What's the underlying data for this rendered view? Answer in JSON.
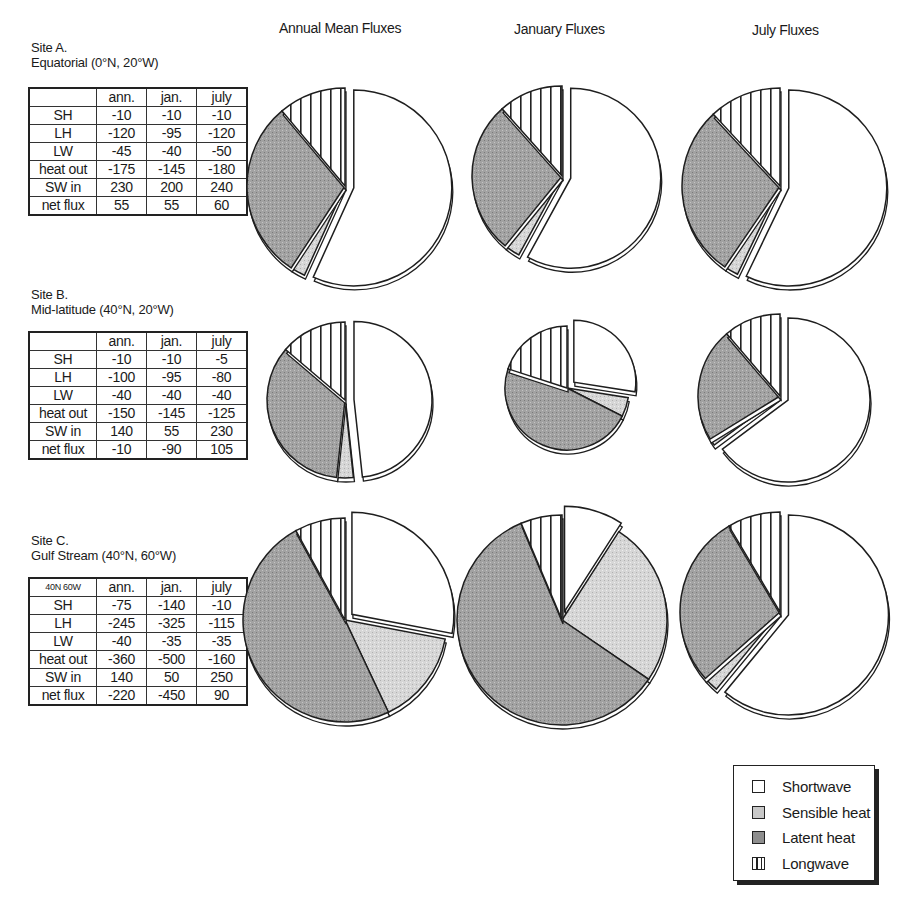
{
  "columns": {
    "annual": "Annual Mean Fluxes",
    "january": "January Fluxes",
    "july": "July Fluxes"
  },
  "sites": [
    {
      "title_line1": "Site A.",
      "title_line2": "Equatorial (0°N, 20°W)",
      "corner": "",
      "headers": [
        "ann.",
        "jan.",
        "july"
      ],
      "rows": [
        {
          "label": "SH",
          "values": [
            "-10",
            "-10",
            "-10"
          ]
        },
        {
          "label": "LH",
          "values": [
            "-120",
            "-95",
            "-120"
          ]
        },
        {
          "label": "LW",
          "values": [
            "-45",
            "-40",
            "-50"
          ]
        },
        {
          "label": "heat out",
          "values": [
            "-175",
            "-145",
            "-180"
          ]
        },
        {
          "label": "SW in",
          "values": [
            "230",
            "200",
            "240"
          ]
        },
        {
          "label": "net flux",
          "values": [
            "55",
            "55",
            "60"
          ]
        }
      ]
    },
    {
      "title_line1": "Site B.",
      "title_line2": "Mid-latitude (40°N, 20°W)",
      "corner": "",
      "headers": [
        "ann.",
        "jan.",
        "july"
      ],
      "rows": [
        {
          "label": "SH",
          "values": [
            "-10",
            "-10",
            "-5"
          ]
        },
        {
          "label": "LH",
          "values": [
            "-100",
            "-95",
            "-80"
          ]
        },
        {
          "label": "LW",
          "values": [
            "-40",
            "-40",
            "-40"
          ]
        },
        {
          "label": "heat out",
          "values": [
            "-150",
            "-145",
            "-125"
          ]
        },
        {
          "label": "SW in",
          "values": [
            "140",
            "55",
            "230"
          ]
        },
        {
          "label": "net flux",
          "values": [
            "-10",
            "-90",
            "105"
          ]
        }
      ]
    },
    {
      "title_line1": "Site C.",
      "title_line2": "Gulf Stream (40°N, 60°W)",
      "corner": "40N 60W",
      "headers": [
        "ann.",
        "jan.",
        "july"
      ],
      "rows": [
        {
          "label": "SH",
          "values": [
            "-75",
            "-140",
            "-10"
          ]
        },
        {
          "label": "LH",
          "values": [
            "-245",
            "-325",
            "-115"
          ]
        },
        {
          "label": "LW",
          "values": [
            "-40",
            "-35",
            "-35"
          ]
        },
        {
          "label": "heat out",
          "values": [
            "-360",
            "-500",
            "-160"
          ]
        },
        {
          "label": "SW in",
          "values": [
            "140",
            "50",
            "250"
          ]
        },
        {
          "label": "net flux",
          "values": [
            "-220",
            "-450",
            "90"
          ]
        }
      ]
    }
  ],
  "legend": [
    {
      "key": "shortwave",
      "label": "Shortwave"
    },
    {
      "key": "sensible",
      "label": "Sensible heat"
    },
    {
      "key": "latent",
      "label": "Latent heat"
    },
    {
      "key": "longwave",
      "label": "Longwave"
    }
  ],
  "colors": {
    "shortwave": "#ffffff",
    "sensible": "#d4d4d4",
    "latent": "#9a9a9a",
    "longwave_stripe": "#222222",
    "outline": "#1e1e1e"
  },
  "chart_data": [
    {
      "type": "pie",
      "title": "Site A. Equatorial (0°N, 20°W) — Annual Mean Fluxes",
      "categories": [
        "Shortwave",
        "Sensible heat",
        "Latent heat",
        "Longwave"
      ],
      "values": [
        230,
        10,
        120,
        45
      ]
    },
    {
      "type": "pie",
      "title": "Site A. Equatorial (0°N, 20°W) — January Fluxes",
      "categories": [
        "Shortwave",
        "Sensible heat",
        "Latent heat",
        "Longwave"
      ],
      "values": [
        200,
        10,
        95,
        40
      ]
    },
    {
      "type": "pie",
      "title": "Site A. Equatorial (0°N, 20°W) — July Fluxes",
      "categories": [
        "Shortwave",
        "Sensible heat",
        "Latent heat",
        "Longwave"
      ],
      "values": [
        240,
        10,
        120,
        50
      ]
    },
    {
      "type": "pie",
      "title": "Site B. Mid-latitude (40°N, 20°W) — Annual Mean Fluxes",
      "categories": [
        "Shortwave",
        "Sensible heat",
        "Latent heat",
        "Longwave"
      ],
      "values": [
        140,
        10,
        100,
        40
      ]
    },
    {
      "type": "pie",
      "title": "Site B. Mid-latitude (40°N, 20°W) — January Fluxes",
      "categories": [
        "Shortwave",
        "Sensible heat",
        "Latent heat",
        "Longwave"
      ],
      "values": [
        55,
        10,
        95,
        40
      ]
    },
    {
      "type": "pie",
      "title": "Site B. Mid-latitude (40°N, 20°W) — July Fluxes",
      "categories": [
        "Shortwave",
        "Sensible heat",
        "Latent heat",
        "Longwave"
      ],
      "values": [
        230,
        5,
        80,
        40
      ]
    },
    {
      "type": "pie",
      "title": "Site C. Gulf Stream (40°N, 60°W) — Annual Mean Fluxes",
      "categories": [
        "Shortwave",
        "Sensible heat",
        "Latent heat",
        "Longwave"
      ],
      "values": [
        140,
        75,
        245,
        40
      ]
    },
    {
      "type": "pie",
      "title": "Site C. Gulf Stream (40°N, 60°W) — January Fluxes",
      "categories": [
        "Shortwave",
        "Sensible heat",
        "Latent heat",
        "Longwave"
      ],
      "values": [
        50,
        140,
        325,
        35
      ]
    },
    {
      "type": "pie",
      "title": "Site C. Gulf Stream (40°N, 60°W) — July Fluxes",
      "categories": [
        "Shortwave",
        "Sensible heat",
        "Latent heat",
        "Longwave"
      ],
      "values": [
        250,
        10,
        115,
        35
      ]
    }
  ],
  "layout": {
    "pies": [
      {
        "cx": 345,
        "cy": 186,
        "r": 98
      },
      {
        "cx": 562,
        "cy": 176,
        "r": 90
      },
      {
        "cx": 780,
        "cy": 186,
        "r": 98
      },
      {
        "cx": 345,
        "cy": 400,
        "r": 78
      },
      {
        "cx": 567,
        "cy": 388,
        "r": 62
      },
      {
        "cx": 780,
        "cy": 396,
        "r": 82
      },
      {
        "cx": 345,
        "cy": 620,
        "r": 102
      },
      {
        "cx": 562,
        "cy": 620,
        "r": 105
      },
      {
        "cx": 780,
        "cy": 612,
        "r": 100
      }
    ]
  }
}
